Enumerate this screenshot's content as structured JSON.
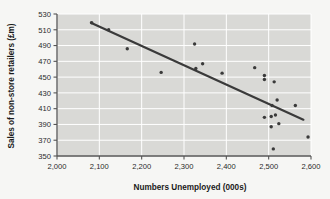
{
  "chart_data": {
    "type": "scatter",
    "title": "",
    "xlabel": "Numbers Unemployed (000s)",
    "ylabel": "Sales of non-store retailers (£m)",
    "xlim": [
      2000,
      2600
    ],
    "ylim": [
      350,
      530
    ],
    "xticks": [
      2000,
      2100,
      2200,
      2300,
      2400,
      2500,
      2600
    ],
    "xticklabels": [
      "2,000",
      "2,100",
      "2,200",
      "2,300",
      "2,400",
      "2,500",
      "2,600"
    ],
    "yticks": [
      350,
      370,
      390,
      410,
      430,
      450,
      470,
      490,
      510,
      530
    ],
    "yticklabels": [
      "350",
      "370",
      "390",
      "410",
      "430",
      "450",
      "470",
      "490",
      "510",
      "530"
    ],
    "grid": true,
    "grid_color": "#ffffff",
    "plot_bg": "#d9d9d6",
    "marker_color": "#3a3a3a",
    "legend": null,
    "points": [
      {
        "x": 2082,
        "y": 519
      },
      {
        "x": 2122,
        "y": 510
      },
      {
        "x": 2166,
        "y": 486
      },
      {
        "x": 2246,
        "y": 456
      },
      {
        "x": 2325,
        "y": 492
      },
      {
        "x": 2328,
        "y": 461
      },
      {
        "x": 2344,
        "y": 467
      },
      {
        "x": 2390,
        "y": 455
      },
      {
        "x": 2467,
        "y": 462
      },
      {
        "x": 2490,
        "y": 452
      },
      {
        "x": 2490,
        "y": 447
      },
      {
        "x": 2513,
        "y": 444
      },
      {
        "x": 2508,
        "y": 414
      },
      {
        "x": 2520,
        "y": 421
      },
      {
        "x": 2563,
        "y": 414
      },
      {
        "x": 2490,
        "y": 399
      },
      {
        "x": 2506,
        "y": 400
      },
      {
        "x": 2516,
        "y": 402
      },
      {
        "x": 2524,
        "y": 391
      },
      {
        "x": 2506,
        "y": 387
      },
      {
        "x": 2593,
        "y": 374
      },
      {
        "x": 2511,
        "y": 359
      }
    ],
    "trendline": {
      "type": "linear",
      "x_start": 2080,
      "y_start": 519,
      "x_end": 2582,
      "y_end": 396,
      "color": "#3a3a3a",
      "width": 2.2
    }
  }
}
